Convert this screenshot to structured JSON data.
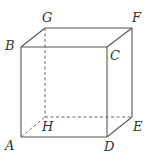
{
  "diagram": {
    "type": "cube",
    "colors": {
      "line": "#555555",
      "label": "#333333",
      "background": "#ffffff"
    },
    "vertices": {
      "A": {
        "label": "A",
        "x": 21,
        "y": 137
      },
      "B": {
        "label": "B",
        "x": 21,
        "y": 47
      },
      "C": {
        "label": "C",
        "x": 107,
        "y": 47
      },
      "D": {
        "label": "D",
        "x": 107,
        "y": 137
      },
      "E": {
        "label": "E",
        "x": 132,
        "y": 117
      },
      "F": {
        "label": "F",
        "x": 132,
        "y": 28
      },
      "G": {
        "label": "G",
        "x": 45,
        "y": 28
      },
      "H": {
        "label": "H",
        "x": 45,
        "y": 117
      }
    },
    "solid_edges": [
      "AB",
      "BC",
      "CD",
      "DA",
      "BG",
      "GF",
      "CF",
      "FE",
      "DE"
    ],
    "hidden_edges": [
      "GH",
      "HE",
      "AH"
    ]
  }
}
